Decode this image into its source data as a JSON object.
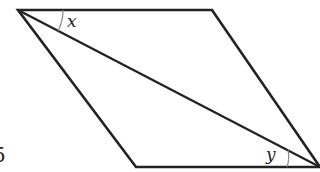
{
  "figure": {
    "shape": "parallelogram with diagonal",
    "labels": {
      "angle_top": "x",
      "angle_bottom": "y",
      "figure_number": "5"
    },
    "colors": {
      "stroke": "#222222",
      "arc": "#888888",
      "background": "#ffffff"
    }
  }
}
